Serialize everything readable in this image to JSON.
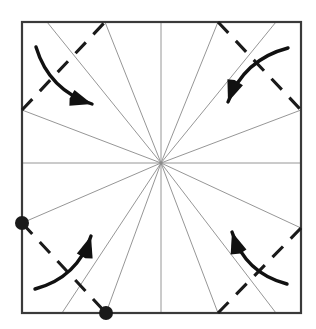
{
  "figure": {
    "type": "origami-crease-pattern",
    "canvas": {
      "width": 316,
      "height": 329,
      "background": "#ffffff"
    },
    "colors": {
      "paper_border": "#3a3a3a",
      "crease_line": "#8a8a8a",
      "valley_fold": "#1a1a1a",
      "arrow": "#111111",
      "dot": "#1a1a1a"
    },
    "square": {
      "label": "paper-outline",
      "left": 22,
      "top": 22,
      "right": 301,
      "bottom": 313,
      "stroke_width": 2.2
    },
    "center_point": {
      "x": 161,
      "y": 163
    },
    "radial_creases": {
      "label": "radial-crease-lines",
      "count": 16,
      "stroke_width": 0.9,
      "endpoints": [
        {
          "name": "crease-left-horizontal",
          "x": 22,
          "y": 163
        },
        {
          "name": "crease-right-horizontal",
          "x": 301,
          "y": 163
        },
        {
          "name": "crease-top-vertical",
          "x": 161,
          "y": 22
        },
        {
          "name": "crease-bottom-vertical",
          "x": 161,
          "y": 313
        },
        {
          "name": "crease-upper-left-shallow",
          "x": 22,
          "y": 110
        },
        {
          "name": "crease-upper-left-steep",
          "x": 47,
          "y": 22
        },
        {
          "name": "crease-upper-left-mid",
          "x": 105,
          "y": 22
        },
        {
          "name": "crease-upper-right-mid",
          "x": 218,
          "y": 22
        },
        {
          "name": "crease-upper-right-steep",
          "x": 276,
          "y": 22
        },
        {
          "name": "crease-upper-right-shallow",
          "x": 301,
          "y": 110
        },
        {
          "name": "crease-lower-right-shallow",
          "x": 301,
          "y": 228
        },
        {
          "name": "crease-lower-right-steep",
          "x": 276,
          "y": 313
        },
        {
          "name": "crease-lower-right-mid",
          "x": 218,
          "y": 313
        },
        {
          "name": "crease-lower-left-mid",
          "x": 106,
          "y": 313
        },
        {
          "name": "crease-lower-left-steep",
          "x": 62,
          "y": 313
        },
        {
          "name": "crease-lower-left-shallow",
          "x": 22,
          "y": 223
        }
      ]
    },
    "valley_folds": [
      {
        "name": "valley-fold-top-left",
        "x1": 22,
        "y1": 110,
        "x2": 105,
        "y2": 22
      },
      {
        "name": "valley-fold-top-right",
        "x1": 218,
        "y1": 22,
        "x2": 301,
        "y2": 110
      },
      {
        "name": "valley-fold-bottom-left",
        "x1": 22,
        "y1": 223,
        "x2": 106,
        "y2": 313
      },
      {
        "name": "valley-fold-bottom-right",
        "x1": 218,
        "y1": 313,
        "x2": 301,
        "y2": 228
      }
    ],
    "fold_arrows": [
      {
        "name": "fold-arrow-top-left",
        "direction": "down-right",
        "from": [
          36,
          47
        ],
        "to": [
          92,
          104
        ]
      },
      {
        "name": "fold-arrow-top-right",
        "direction": "down-left",
        "to": [
          228,
          102
        ],
        "from": [
          288,
          48
        ]
      },
      {
        "name": "fold-arrow-bottom-left",
        "direction": "up-right",
        "from": [
          35,
          289
        ],
        "to": [
          91,
          236
        ]
      },
      {
        "name": "fold-arrow-bottom-right",
        "direction": "up-left",
        "from": [
          287,
          284
        ],
        "to": [
          232,
          232
        ]
      }
    ],
    "reference_dots": [
      {
        "name": "reference-dot-left-edge",
        "x": 22,
        "y": 223,
        "r": 7
      },
      {
        "name": "reference-dot-bottom-edge",
        "x": 106,
        "y": 313,
        "r": 7
      }
    ]
  }
}
